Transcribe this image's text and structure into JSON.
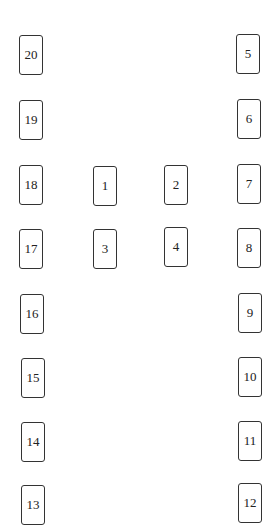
{
  "top_mark": "¨",
  "seats": [
    {
      "label": "20",
      "x": 19,
      "y": 35
    },
    {
      "label": "19",
      "x": 19,
      "y": 100
    },
    {
      "label": "18",
      "x": 19,
      "y": 165
    },
    {
      "label": "17",
      "x": 19,
      "y": 229
    },
    {
      "label": "16",
      "x": 20,
      "y": 294
    },
    {
      "label": "15",
      "x": 21,
      "y": 358
    },
    {
      "label": "14",
      "x": 21,
      "y": 422
    },
    {
      "label": "13",
      "x": 21,
      "y": 485
    },
    {
      "label": "1",
      "x": 93,
      "y": 166
    },
    {
      "label": "2",
      "x": 164,
      "y": 165
    },
    {
      "label": "3",
      "x": 93,
      "y": 229
    },
    {
      "label": "4",
      "x": 164,
      "y": 227
    },
    {
      "label": "5",
      "x": 236,
      "y": 34
    },
    {
      "label": "6",
      "x": 237,
      "y": 99
    },
    {
      "label": "7",
      "x": 237,
      "y": 164
    },
    {
      "label": "8",
      "x": 237,
      "y": 228
    },
    {
      "label": "9",
      "x": 238,
      "y": 293
    },
    {
      "label": "10",
      "x": 238,
      "y": 357
    },
    {
      "label": "11",
      "x": 238,
      "y": 421
    },
    {
      "label": "12",
      "x": 238,
      "y": 483
    }
  ]
}
